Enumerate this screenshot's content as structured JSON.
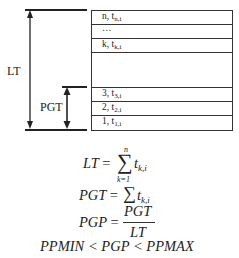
{
  "diagram": {
    "left_labels": {
      "lt": "LT",
      "pgt": "PGT"
    },
    "stack_rows": [
      {
        "index": "n",
        "var": "t",
        "sub": "n,i"
      },
      {
        "index": "…",
        "var": "",
        "sub": ""
      },
      {
        "index": "k",
        "var": "t",
        "sub": "k,i"
      },
      {
        "index": "",
        "var": "",
        "sub": ""
      },
      {
        "index": "3",
        "var": "t",
        "sub": "3,i"
      },
      {
        "index": "2",
        "var": "t",
        "sub": "2,i"
      },
      {
        "index": "1",
        "var": "t",
        "sub": "1,i"
      }
    ],
    "row_text": {
      "r0_idx": "n, ",
      "r0_var": "t",
      "r0_sub": "n,i",
      "r1_idx": "…",
      "r2_idx": "k, ",
      "r2_var": "t",
      "r2_sub": "k,i",
      "r4_idx": "3, ",
      "r4_var": "t",
      "r4_sub": "3,i",
      "r5_idx": "2, ",
      "r5_var": "t",
      "r5_sub": "2,i",
      "r6_idx": "1, ",
      "r6_var": "t",
      "r6_sub": "1,i"
    }
  },
  "equations": {
    "eq1": {
      "lhs": "LT",
      "eq": "=",
      "sigma": "∑",
      "upper": "n",
      "lower": "k=1",
      "term": "t",
      "term_sub": "k,i"
    },
    "eq2": {
      "lhs": "PGT",
      "eq": "=",
      "sigma": "∑",
      "term": "t",
      "term_sub": "k,i"
    },
    "eq3": {
      "lhs": "PGP",
      "eq": "=",
      "numerator": "PGT",
      "denominator": "LT"
    },
    "eq4": {
      "text": "PPMIN < PGP < PPMAX"
    }
  },
  "colors": {
    "line": "#222222",
    "background": "#ffffff"
  }
}
